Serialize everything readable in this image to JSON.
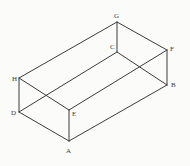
{
  "figure": {
    "kind": "geometry-diagram",
    "shape_name": "rectangular-cuboid",
    "background_color": "#fbfbfa",
    "line_color": "#3c3c3c",
    "label_color": "#3a3a3a",
    "line_width": 1,
    "width": 190,
    "height": 166,
    "vertices": [
      {
        "label": "A",
        "x": 69,
        "y": 141,
        "label_x": 66,
        "label_y": 148
      },
      {
        "label": "B",
        "x": 167,
        "y": 85,
        "label_x": 171,
        "label_y": 82
      },
      {
        "label": "C",
        "x": 117,
        "y": 52,
        "label_x": 110,
        "label_y": 44
      },
      {
        "label": "D",
        "x": 19,
        "y": 112,
        "label_x": 11,
        "label_y": 110
      },
      {
        "label": "E",
        "x": 69,
        "y": 110,
        "label_x": 72,
        "label_y": 111
      },
      {
        "label": "F",
        "x": 167,
        "y": 50,
        "label_x": 170,
        "label_y": 46
      },
      {
        "label": "G",
        "x": 117,
        "y": 22,
        "label_x": 114,
        "label_y": 13
      },
      {
        "label": "H",
        "x": 19,
        "y": 78,
        "label_x": 12,
        "label_y": 76
      }
    ],
    "edges": [
      {
        "name": "edge-A-B",
        "from": "A",
        "to": "B",
        "style": "solid"
      },
      {
        "name": "edge-A-D",
        "from": "A",
        "to": "D",
        "style": "solid"
      },
      {
        "name": "edge-A-E",
        "from": "A",
        "to": "E",
        "style": "solid"
      },
      {
        "name": "edge-B-C",
        "from": "B",
        "to": "C",
        "style": "solid"
      },
      {
        "name": "edge-B-F",
        "from": "B",
        "to": "F",
        "style": "solid"
      },
      {
        "name": "edge-C-D",
        "from": "C",
        "to": "D",
        "style": "solid"
      },
      {
        "name": "edge-C-G",
        "from": "C",
        "to": "G",
        "style": "solid"
      },
      {
        "name": "edge-D-H",
        "from": "D",
        "to": "H",
        "style": "solid"
      },
      {
        "name": "edge-E-F",
        "from": "E",
        "to": "F",
        "style": "solid"
      },
      {
        "name": "edge-E-H",
        "from": "E",
        "to": "H",
        "style": "solid"
      },
      {
        "name": "edge-F-G",
        "from": "F",
        "to": "G",
        "style": "solid"
      },
      {
        "name": "edge-G-H",
        "from": "G",
        "to": "H",
        "style": "solid"
      }
    ]
  }
}
